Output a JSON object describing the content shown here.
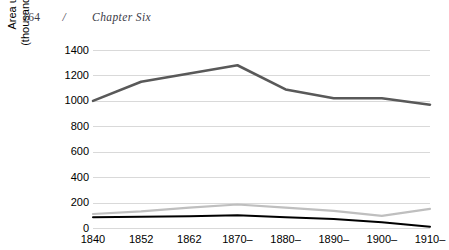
{
  "running_head": {
    "page_number": "164",
    "separator": "/",
    "chapter_title": "Chapter Six"
  },
  "chart_data": {
    "type": "line",
    "title": "",
    "xlabel": "",
    "ylabel": "Area under vines (thousands of hectares)",
    "ylabel_line1": "Area under vines",
    "ylabel_line2": "(thousands of hectares)",
    "categories": [
      "1840",
      "1852",
      "1862",
      "1870–",
      "1880–",
      "1890–",
      "1900–",
      "1910–"
    ],
    "ylim": [
      0,
      1400
    ],
    "ytick_values": [
      0,
      200,
      400,
      600,
      800,
      1000,
      1200,
      1400
    ],
    "ytick_labels": [
      "0",
      "200",
      "400",
      "600",
      "800",
      "1000",
      "1200",
      "1400"
    ],
    "grid": true,
    "legend": "none",
    "series": [
      {
        "name": "series-dark-gray",
        "color": "#595959",
        "width": 2.6,
        "values": [
          1000,
          1150,
          1215,
          1280,
          1090,
          1020,
          1020,
          970
        ]
      },
      {
        "name": "series-light-gray",
        "color": "#bfbfbf",
        "width": 2.2,
        "values": [
          110,
          130,
          160,
          185,
          160,
          135,
          95,
          150
        ]
      },
      {
        "name": "series-black",
        "color": "#000000",
        "width": 2.0,
        "values": [
          85,
          88,
          92,
          100,
          85,
          70,
          45,
          10
        ]
      }
    ]
  }
}
